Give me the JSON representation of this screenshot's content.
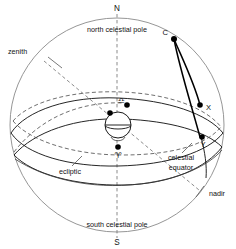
{
  "diagram": {
    "type": "astronomical-celestial-sphere",
    "width": 236,
    "height": 249,
    "background_color": "#ffffff",
    "line_color": "#1a1a1a",
    "outline_color": "#8a8a8a",
    "dashed_color": "#555555"
  },
  "labels": {
    "north_cardinal": "N",
    "south_cardinal": "S",
    "north_celestial_pole": "north celestial pole",
    "south_celestial_pole": "south celestial pole",
    "zenith": "zenith",
    "nadir": "nadir",
    "ecliptic": "ecliptic",
    "celestial_equator_line1": "celestial",
    "celestial_equator_line2": "equator"
  },
  "points": {
    "c": {
      "label": "C",
      "x": 174,
      "y": 39
    },
    "x": {
      "label": "X",
      "x": 200,
      "y": 105
    },
    "y": {
      "label": "Y",
      "x": 203,
      "y": 137
    },
    "vernal_equinox": {
      "label": "♈",
      "name": "aries-vernal-equinox-symbol",
      "x": 118,
      "y": 147
    },
    "autumnal_equinox": {
      "label": "♎",
      "name": "libra-autumnal-equinox-symbol",
      "x": 121,
      "y": 108
    }
  },
  "geometry": {
    "sphere_center_x": 117,
    "sphere_center_y": 125,
    "sphere_radius": 107,
    "earth_center_x": 118,
    "earth_center_y": 125,
    "earth_radius": 13,
    "polar_axis_top_y": 14,
    "polar_axis_bottom_y": 238
  }
}
